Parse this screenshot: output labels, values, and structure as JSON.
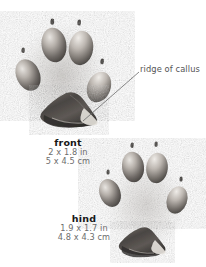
{
  "illustration": {
    "medium": "pencil-drawing",
    "subject": "animal-track-paw-prints",
    "background_color": "#ffffff",
    "ink_color": "#4a4a4a"
  },
  "annotations": {
    "callus": {
      "text": "ridge of callus",
      "color": "#555555",
      "leader_line": {
        "from_x": 139,
        "from_y": 72,
        "to_x": 83,
        "to_y": 121
      }
    }
  },
  "tracks": [
    {
      "id": "front",
      "name": "front",
      "measure_imperial": "2 x 1.8 in",
      "measure_metric": "5 x 4.5 cm",
      "toe_count": 4,
      "claw_count": 4
    },
    {
      "id": "hind",
      "name": "hind",
      "measure_imperial": "1.9 x 1.7 in",
      "measure_metric": "4.8 x 4.3 cm",
      "toe_count": 4,
      "claw_count": 4
    }
  ],
  "colors": {
    "label_name": "#171717",
    "label_measure": "#6d6d6d",
    "annotation": "#555555",
    "pad_dark": "#3f3c3a",
    "pad_mid": "#7d7874",
    "pad_light": "#cfcac4",
    "smudge": "#b9b5b0"
  }
}
